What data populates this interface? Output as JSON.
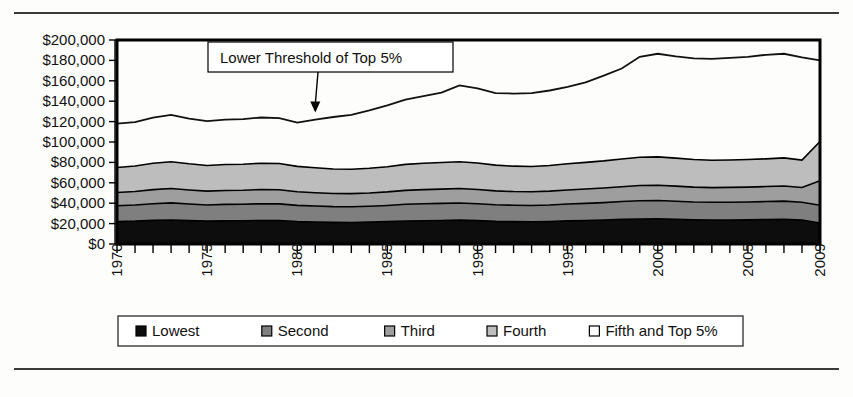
{
  "chart_data": {
    "type": "area",
    "title": "",
    "xlabel": "",
    "ylabel": "",
    "ylim": [
      0,
      200000
    ],
    "ytick_step": 20000,
    "grid": false,
    "legend_position": "bottom",
    "y_tick_labels": [
      "$200,000",
      "$180,000",
      "$160,000",
      "$140,000",
      "$120,000",
      "$100,000",
      "$80,000",
      "$60,000",
      "$40,000",
      "$20,000",
      "$0"
    ],
    "x_tick_labels": [
      "1970",
      "1975",
      "1980",
      "1985",
      "1990",
      "1995",
      "2000",
      "2005",
      "2009"
    ],
    "x": [
      1970,
      1971,
      1972,
      1973,
      1974,
      1975,
      1976,
      1977,
      1978,
      1979,
      1980,
      1981,
      1982,
      1983,
      1984,
      1985,
      1986,
      1987,
      1988,
      1989,
      1990,
      1991,
      1992,
      1993,
      1994,
      1995,
      1996,
      1997,
      1998,
      1999,
      2000,
      2001,
      2002,
      2003,
      2004,
      2005,
      2006,
      2007,
      2008,
      2009
    ],
    "categories": [
      1970,
      1971,
      1972,
      1973,
      1974,
      1975,
      1976,
      1977,
      1978,
      1979,
      1980,
      1981,
      1982,
      1983,
      1984,
      1985,
      1986,
      1987,
      1988,
      1989,
      1990,
      1991,
      1992,
      1993,
      1994,
      1995,
      1996,
      1997,
      1998,
      1999,
      2000,
      2001,
      2002,
      2003,
      2004,
      2005,
      2006,
      2007,
      2008,
      2009
    ],
    "annotations": [
      {
        "text": "Lower Threshold of Top 5%",
        "points_to_year": 1981,
        "points_to_value": 128000
      }
    ],
    "series": [
      {
        "name": "Lowest",
        "color": "#0d0d0d",
        "stacked_upper_bound": true,
        "values": [
          22000,
          22400,
          23200,
          23600,
          22900,
          22400,
          22700,
          22800,
          23100,
          23000,
          22100,
          21600,
          21200,
          21100,
          21400,
          21900,
          22600,
          22800,
          23100,
          23400,
          22900,
          22200,
          21900,
          21800,
          22100,
          22700,
          23000,
          23500,
          24100,
          24500,
          24600,
          24100,
          23700,
          23500,
          23600,
          23700,
          24000,
          24200,
          23500,
          20500
        ]
      },
      {
        "name": "Second",
        "color": "#7f7f7f",
        "stacked_upper_bound": true,
        "values": [
          37500,
          38200,
          39500,
          40300,
          39200,
          38300,
          38800,
          39000,
          39500,
          39300,
          37900,
          37200,
          36600,
          36500,
          37000,
          37800,
          38900,
          39400,
          39800,
          40200,
          39500,
          38500,
          38000,
          37800,
          38300,
          39200,
          39800,
          40600,
          41600,
          42400,
          42600,
          41900,
          41200,
          40900,
          41000,
          41200,
          41600,
          42000,
          40900,
          38000
        ]
      },
      {
        "name": "Third",
        "color": "#9e9e9e",
        "stacked_upper_bound": true,
        "values": [
          50500,
          51500,
          53300,
          54400,
          53000,
          51800,
          52500,
          52700,
          53400,
          53200,
          51300,
          50300,
          49500,
          49400,
          50000,
          51100,
          52600,
          53300,
          53800,
          54400,
          53500,
          52100,
          51400,
          51200,
          51800,
          53000,
          53900,
          54900,
          56200,
          57300,
          57600,
          56700,
          55800,
          55300,
          55500,
          55800,
          56300,
          56900,
          55400,
          62000
        ]
      },
      {
        "name": "Fourth",
        "color": "#bdbdbd",
        "stacked_upper_bound": true,
        "values": [
          75000,
          76400,
          79100,
          80700,
          78600,
          76900,
          77900,
          78200,
          79200,
          78900,
          76100,
          74700,
          73500,
          73300,
          74200,
          75800,
          78100,
          79100,
          79900,
          80700,
          79400,
          77300,
          76300,
          76000,
          76900,
          78600,
          80000,
          81500,
          83400,
          85000,
          85400,
          84200,
          82800,
          82100,
          82400,
          82800,
          83500,
          84400,
          82200,
          100500
        ]
      },
      {
        "name": "Fifth and Top 5%",
        "color": "#ffffff",
        "is_threshold_line": true,
        "values": [
          118000,
          119500,
          124000,
          126500,
          123000,
          120500,
          122000,
          122500,
          124000,
          123500,
          119000,
          122000,
          124500,
          126500,
          131000,
          136000,
          141500,
          145000,
          148500,
          155500,
          152500,
          148000,
          147500,
          148000,
          150500,
          154000,
          158500,
          165000,
          172000,
          183500,
          186500,
          184000,
          182000,
          181500,
          182500,
          183500,
          185500,
          186500,
          183000,
          180000
        ]
      }
    ]
  },
  "legend": {
    "items": [
      {
        "label": "Lowest",
        "color": "#0d0d0d"
      },
      {
        "label": "Second",
        "color": "#7f7f7f"
      },
      {
        "label": "Third",
        "color": "#9e9e9e"
      },
      {
        "label": "Fourth",
        "color": "#bdbdbd"
      },
      {
        "label": "Fifth and Top 5%",
        "color": "#ffffff"
      }
    ]
  }
}
